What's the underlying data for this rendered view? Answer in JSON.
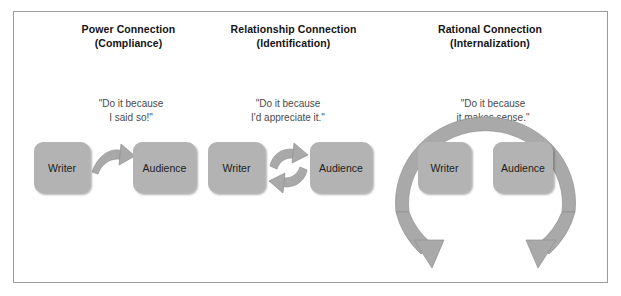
{
  "diagram": {
    "title_absent": true,
    "panels": [
      {
        "id": "power",
        "heading_main": "Power Connection",
        "heading_sub": "(Compliance)",
        "quote_line1": "\"Do it because",
        "quote_line2": "I said so!\"",
        "left_box": "Writer",
        "right_box": "Audience",
        "connector": "single-curved-arrow-right"
      },
      {
        "id": "relationship",
        "heading_main": "Relationship Connection",
        "heading_sub": "(Identification)",
        "quote_line1": "\"Do it because",
        "quote_line2": "I'd appreciate it.\"",
        "left_box": "Writer",
        "right_box": "Audience",
        "connector": "two-curved-arrows-cycle"
      },
      {
        "id": "rational",
        "heading_main": "Rational Connection",
        "heading_sub": "(Internalization)",
        "quote_line1": "\"Do it because",
        "quote_line2": "it makes sense.\"",
        "left_box": "Writer",
        "right_box": "Audience",
        "connector": "large-circular-arc-two-arrowheads"
      }
    ],
    "colors": {
      "box_fill": "#b3b3b3",
      "arrow_fill": "#a9a9a9",
      "arrow_stroke": "#8f8f8f",
      "frame_border": "#9b9b9b",
      "heading_text": "#131313",
      "quote_text": "#4a4a4a",
      "box_text": "#1c1c1c",
      "page_background": "#ffffff"
    }
  }
}
